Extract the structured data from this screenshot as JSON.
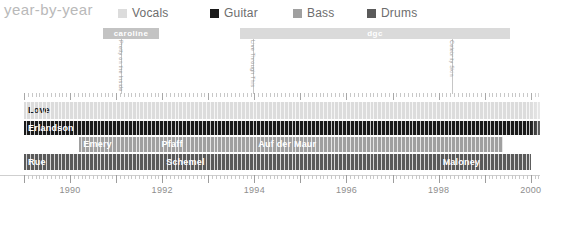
{
  "header": {
    "title": "year-by-year",
    "legend": [
      {
        "label": "Vocals",
        "color": "#dcdcdc",
        "x": 118
      },
      {
        "label": "Guitar",
        "color": "#1a1a1a",
        "x": 210
      },
      {
        "label": "Bass",
        "color": "#a0a0a0",
        "x": 293
      },
      {
        "label": "Drums",
        "color": "#5a5a5a",
        "x": 367
      }
    ]
  },
  "record_labels": [
    {
      "name": "caroline",
      "start": 103,
      "width": 56,
      "color": "#c3c3c3"
    },
    {
      "name": "dgc",
      "start": 240,
      "width": 270,
      "color": "#dadada"
    }
  ],
  "albums": [
    {
      "title": "Pretty on the Inside",
      "x": 121
    },
    {
      "title": "Live Through This",
      "x": 253
    },
    {
      "title": "Celebrity Skin",
      "x": 452
    }
  ],
  "chart_data": {
    "type": "timeline",
    "title": "year-by-year",
    "xlabel": "",
    "ylabel": "",
    "xlim": [
      1989.0,
      2000.2
    ],
    "tick_labels": [
      "1990",
      "1992",
      "1994",
      "1996",
      "1998",
      "2000"
    ],
    "tick_values": [
      1990,
      1992,
      1994,
      1996,
      1998,
      2000
    ],
    "grid": false,
    "legend_position": "top",
    "series": [
      {
        "name": "Vocals",
        "color": "#dcdcdc",
        "text_color": "#1a1a1a",
        "members": [
          {
            "name": "Love",
            "start": 1989.0,
            "end": 2000.2
          }
        ]
      },
      {
        "name": "Guitar",
        "color": "#1a1a1a",
        "text_color": "#ffffff",
        "members": [
          {
            "name": "Erlandson",
            "start": 1989.0,
            "end": 2000.2
          }
        ]
      },
      {
        "name": "Bass",
        "color": "#a0a0a0",
        "text_color": "#ffffff",
        "members": [
          {
            "name": "Emery",
            "start": 1990.2,
            "end": 1991.9
          },
          {
            "name": "Pfaff",
            "start": 1991.9,
            "end": 1994.0
          },
          {
            "name": "Auf der Maur",
            "start": 1994.0,
            "end": 1999.4
          }
        ]
      },
      {
        "name": "Drums",
        "color": "#5a5a5a",
        "text_color": "#ffffff",
        "members": [
          {
            "name": "Rue",
            "start": 1989.0,
            "end": 1992.0
          },
          {
            "name": "Schemel",
            "start": 1992.0,
            "end": 1998.0
          },
          {
            "name": "Maloney",
            "start": 1998.0,
            "end": 2000.0
          }
        ]
      }
    ]
  }
}
